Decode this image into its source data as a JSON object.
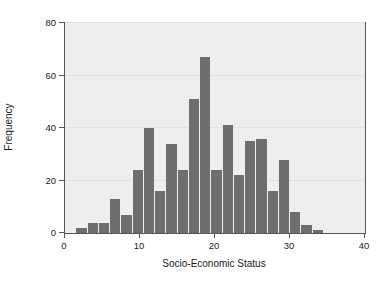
{
  "chart_data": {
    "type": "bar",
    "title": "",
    "subtitle": "",
    "xlabel": "Socio-Economic Status",
    "ylabel": "Frequency",
    "xlim": [
      0,
      40
    ],
    "ylim": [
      0,
      80
    ],
    "xticks": [
      0,
      10,
      20,
      30,
      40
    ],
    "yticks": [
      0,
      20,
      40,
      60,
      80
    ],
    "xtick_labels": [
      "0",
      "10",
      "20",
      "30",
      "40"
    ],
    "ytick_labels": [
      "0",
      "20",
      "40",
      "60",
      "80"
    ],
    "grid": true,
    "legend": null,
    "bin_width": 1.5,
    "bar_color": "#6e6e6e",
    "plot_background": "#eeeeee",
    "figure_background": "#ffffff",
    "axis_color": "#555555",
    "gridline_color": "#e2e2e2",
    "bins": [
      {
        "x0": 0.0,
        "x1": 1.5,
        "value": 0
      },
      {
        "x0": 1.5,
        "x1": 3.0,
        "value": 2
      },
      {
        "x0": 3.0,
        "x1": 4.5,
        "value": 4
      },
      {
        "x0": 4.5,
        "x1": 6.0,
        "value": 4
      },
      {
        "x0": 6.0,
        "x1": 7.5,
        "value": 13
      },
      {
        "x0": 7.5,
        "x1": 9.0,
        "value": 7
      },
      {
        "x0": 9.0,
        "x1": 10.5,
        "value": 24
      },
      {
        "x0": 10.5,
        "x1": 12.0,
        "value": 40
      },
      {
        "x0": 12.0,
        "x1": 13.5,
        "value": 16
      },
      {
        "x0": 13.5,
        "x1": 15.0,
        "value": 34
      },
      {
        "x0": 15.0,
        "x1": 16.5,
        "value": 24
      },
      {
        "x0": 16.5,
        "x1": 18.0,
        "value": 51
      },
      {
        "x0": 18.0,
        "x1": 19.5,
        "value": 67
      },
      {
        "x0": 19.5,
        "x1": 21.0,
        "value": 24
      },
      {
        "x0": 21.0,
        "x1": 22.5,
        "value": 41
      },
      {
        "x0": 22.5,
        "x1": 24.0,
        "value": 22
      },
      {
        "x0": 24.0,
        "x1": 25.5,
        "value": 35
      },
      {
        "x0": 25.5,
        "x1": 27.0,
        "value": 36
      },
      {
        "x0": 27.0,
        "x1": 28.5,
        "value": 16
      },
      {
        "x0": 28.5,
        "x1": 30.0,
        "value": 28
      },
      {
        "x0": 30.0,
        "x1": 31.5,
        "value": 8
      },
      {
        "x0": 31.5,
        "x1": 33.0,
        "value": 3
      },
      {
        "x0": 33.0,
        "x1": 34.5,
        "value": 1
      },
      {
        "x0": 34.5,
        "x1": 40.0,
        "value": 0
      }
    ],
    "categories": [
      "0-1.5",
      "1.5-3",
      "3-4.5",
      "4.5-6",
      "6-7.5",
      "7.5-9",
      "9-10.5",
      "10.5-12",
      "12-13.5",
      "13.5-15",
      "15-16.5",
      "16.5-18",
      "18-19.5",
      "19.5-21",
      "21-22.5",
      "22.5-24",
      "24-25.5",
      "25.5-27",
      "27-28.5",
      "28.5-30",
      "30-31.5",
      "31.5-33",
      "33-34.5",
      "34.5-40"
    ],
    "values": [
      0,
      2,
      4,
      4,
      13,
      7,
      24,
      40,
      16,
      34,
      24,
      51,
      67,
      24,
      41,
      22,
      35,
      36,
      16,
      28,
      8,
      3,
      1,
      0
    ]
  }
}
